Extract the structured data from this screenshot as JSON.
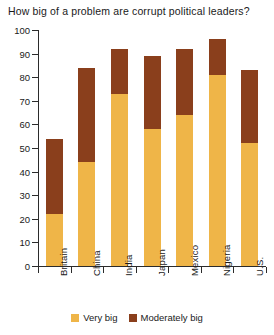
{
  "chart_data": {
    "type": "bar",
    "subtype": "stacked-bar",
    "title": "How big of a problem are corrupt political leaders?",
    "xlabel": "",
    "ylabel": "",
    "ylim": [
      0,
      100
    ],
    "yticks": [
      0,
      10,
      20,
      30,
      40,
      50,
      60,
      70,
      80,
      90,
      100
    ],
    "grid": false,
    "legend_position": "bottom",
    "categories": [
      "Britain",
      "China",
      "India",
      "Japan",
      "Mexico",
      "Nigeria",
      "U.S."
    ],
    "series": [
      {
        "name": "Very big",
        "color": "#efb548",
        "values": [
          22,
          44,
          73,
          58,
          64,
          81,
          52
        ]
      },
      {
        "name": "Moderately big",
        "color": "#8a3f1c",
        "values": [
          32,
          40,
          19,
          31,
          28,
          15,
          31
        ]
      }
    ],
    "totals": [
      54,
      84,
      92,
      89,
      92,
      96,
      83
    ]
  },
  "legend": {
    "items": [
      {
        "label": "Very big",
        "color": "#efb548"
      },
      {
        "label": "Moderately big",
        "color": "#8a3f1c"
      }
    ]
  }
}
